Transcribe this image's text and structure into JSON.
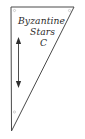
{
  "diagram": {
    "title_line_1": "Byzantine",
    "title_line_2": "Stars",
    "title_line_3": "C",
    "shape": {
      "name": "right-triangle-pennant",
      "vertices": [
        {
          "x": 11,
          "y": 7
        },
        {
          "x": 74,
          "y": 7
        },
        {
          "x": 11.5,
          "y": 131
        }
      ],
      "outline_color": "#4a4a4a",
      "fill_color": "#ffffff",
      "stroke_width": 1
    },
    "dimension_arrow": {
      "name": "height-dimension-arrow",
      "orientation": "vertical",
      "double_headed": true,
      "x": 18.5,
      "y_top": 38,
      "y_bottom": 87,
      "color": "#3a3a3a"
    },
    "corner_marks": [
      {
        "name": "grommet-top-left",
        "x": 14.5,
        "y": 10.5
      },
      {
        "name": "grommet-top-right",
        "x": 69.5,
        "y": 10.5
      },
      {
        "name": "grommet-bottom-left",
        "x": 14.5,
        "y": 112
      }
    ],
    "background_color": "#ffffff"
  }
}
